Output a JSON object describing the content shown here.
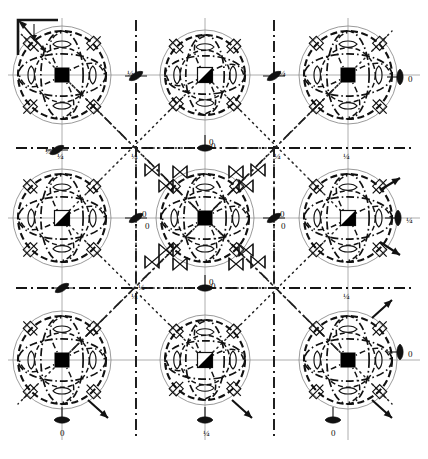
{
  "figure": {
    "kind": "space-group-symmetry-diagram",
    "width": 428,
    "height": 459,
    "background": "#ffffff",
    "ink": "#111111",
    "grid_color": "#8a8a8a",
    "dashdot_color": "#1a1a1a",
    "dotted_color": "#2b2b2b"
  },
  "axes_indicator": {
    "name": "origin-axes",
    "corner_x": 18,
    "corner_y": 22,
    "arrow_down_label": "b",
    "arrow_diag_label": "a",
    "show_labels": false
  },
  "lattice": {
    "columns": 3,
    "rows": 3,
    "x_positions": [
      62,
      205,
      348
    ],
    "y_positions": [
      75,
      218,
      360
    ],
    "cell_left": 62,
    "cell_top": 75,
    "cell_right": 348,
    "cell_bottom": 360
  },
  "rosettes": [
    {
      "id": "r-00",
      "cx": 62,
      "cy": 75,
      "center_glyph": "filled-square",
      "radius": 49
    },
    {
      "id": "r-10",
      "cx": 205,
      "cy": 75,
      "center_glyph": "half-filled-square",
      "radius": 45
    },
    {
      "id": "r-20",
      "cx": 348,
      "cy": 75,
      "center_glyph": "filled-square",
      "radius": 49
    },
    {
      "id": "r-01",
      "cx": 62,
      "cy": 218,
      "center_glyph": "half-filled-square",
      "radius": 49
    },
    {
      "id": "r-11",
      "cx": 205,
      "cy": 218,
      "center_glyph": "filled-square",
      "radius": 49
    },
    {
      "id": "r-21",
      "cx": 348,
      "cy": 218,
      "center_glyph": "half-filled-square",
      "radius": 49
    },
    {
      "id": "r-02",
      "cx": 62,
      "cy": 360,
      "center_glyph": "filled-square",
      "radius": 49
    },
    {
      "id": "r-12",
      "cx": 205,
      "cy": 360,
      "center_glyph": "half-filled-square",
      "radius": 45
    },
    {
      "id": "r-22",
      "cx": 348,
      "cy": 360,
      "center_glyph": "filled-square",
      "radius": 49
    }
  ],
  "edge_markers": [
    {
      "id": "em-right-top",
      "x": 400,
      "y": 77,
      "glyph": "filled-lens-vertical",
      "label": "0",
      "label_dx": 8,
      "label_dy": 3
    },
    {
      "id": "em-right-mid",
      "x": 398,
      "y": 218,
      "glyph": "filled-lens-vertical",
      "label": "¼",
      "label_dx": 8,
      "label_dy": 3
    },
    {
      "id": "em-right-bottom",
      "x": 400,
      "y": 352,
      "glyph": "filled-lens-vertical",
      "label": "0",
      "label_dx": 8,
      "label_dy": 3
    },
    {
      "id": "em-left-mid",
      "x": 57,
      "y": 150,
      "glyph": "filled-lens-tilted",
      "label": "¼",
      "label_dx": -12,
      "label_dy": 2
    },
    {
      "id": "em-bottom-left",
      "x": 62,
      "y": 420,
      "glyph": "filled-lens-horizontal",
      "label": "0",
      "label_dx": -2,
      "label_dy": 14
    },
    {
      "id": "em-bottom-mid",
      "x": 205,
      "y": 420,
      "glyph": "filled-lens-horizontal",
      "label": "¼",
      "label_dx": -2,
      "label_dy": 14
    },
    {
      "id": "em-bottom-right",
      "x": 333,
      "y": 420,
      "glyph": "filled-lens-horizontal",
      "label": "0",
      "label_dx": -2,
      "label_dy": 14
    },
    {
      "id": "em-top-center",
      "x": 136,
      "y": 76,
      "glyph": "filled-lens-tilted",
      "label": "¼",
      "label_dx": -9,
      "label_dy": -2
    },
    {
      "id": "em-top-center-2",
      "x": 274,
      "y": 76,
      "glyph": "filled-lens-tilted",
      "label": "¼",
      "label_dx": 5,
      "label_dy": -2
    },
    {
      "id": "em-mid-band-l",
      "x": 136,
      "y": 218,
      "glyph": "filled-lens-tilted",
      "label": "0",
      "label_dx": 6,
      "label_dy": -3
    },
    {
      "id": "em-mid-band-r",
      "x": 274,
      "y": 218,
      "glyph": "filled-lens-tilted",
      "label": "0",
      "label_dx": 6,
      "label_dy": -3
    },
    {
      "id": "em-center-upper",
      "x": 205,
      "y": 148,
      "glyph": "filled-lens-horizontal",
      "label": "0",
      "label_dx": 4,
      "label_dy": -5
    },
    {
      "id": "em-center-lower",
      "x": 205,
      "y": 288,
      "glyph": "filled-lens-horizontal",
      "label": "0",
      "label_dx": 4,
      "label_dy": -5
    },
    {
      "id": "em-left-low",
      "x": 62,
      "y": 288,
      "glyph": "filled-lens-tilted",
      "label": "",
      "label_dx": 0,
      "label_dy": 0
    },
    {
      "id": "em-mid-left-low",
      "x": 136,
      "y": 288,
      "glyph": "none",
      "label": "¼",
      "label_dx": 2,
      "label_dy": 0
    }
  ],
  "node_labels": [
    {
      "id": "nl-tl",
      "x": 57,
      "y": 152,
      "text": "¼"
    },
    {
      "id": "nl-tm",
      "x": 131,
      "y": 152,
      "text": "¼"
    },
    {
      "id": "nl-tr",
      "x": 274,
      "y": 152,
      "text": "¼"
    },
    {
      "id": "nl-rr",
      "x": 343,
      "y": 152,
      "text": "¼"
    },
    {
      "id": "nl-ml",
      "x": 145,
      "y": 222,
      "text": "0"
    },
    {
      "id": "nl-mr",
      "x": 281,
      "y": 222,
      "text": "0"
    },
    {
      "id": "nl-bl",
      "x": 131,
      "y": 292,
      "text": "¼"
    },
    {
      "id": "nl-bm",
      "x": 211,
      "y": 282,
      "text": "0"
    },
    {
      "id": "nl-br",
      "x": 343,
      "y": 292,
      "text": "¼"
    },
    {
      "id": "nl-cu",
      "x": 211,
      "y": 142,
      "text": "0"
    }
  ],
  "corner_arrows": [
    {
      "id": "ca-br-1",
      "x1": 372,
      "y1": 318,
      "x2": 392,
      "y2": 300
    },
    {
      "id": "ca-br-2",
      "x1": 372,
      "y1": 400,
      "x2": 392,
      "y2": 418
    },
    {
      "id": "ca-br-3",
      "x1": 380,
      "y1": 242,
      "x2": 400,
      "y2": 255
    },
    {
      "id": "ca-br-4",
      "x1": 380,
      "y1": 190,
      "x2": 400,
      "y2": 178
    },
    {
      "id": "ca-bl-1",
      "x1": 88,
      "y1": 400,
      "x2": 108,
      "y2": 418
    },
    {
      "id": "ca-bm-1",
      "x1": 232,
      "y1": 400,
      "x2": 252,
      "y2": 418
    }
  ],
  "glyph_legend": {
    "filled-square": "four-fold rotation axis (filled square)",
    "half-filled-square": "four-fold roto-inversion axis (half filled square)",
    "filled-lens-vertical": "two-fold axis in plane of page",
    "filled-lens-horizontal": "two-fold axis in plane of page",
    "filled-lens-tilted": "two-fold screw axis in plane of page",
    "open-lens": "two-fold rotation point",
    "bowtie": "three-fold / inversion triad marker",
    "dash-dot-line": "mirror plane perpendicular to page",
    "dotted-line": "glide plane (diagonal)"
  }
}
